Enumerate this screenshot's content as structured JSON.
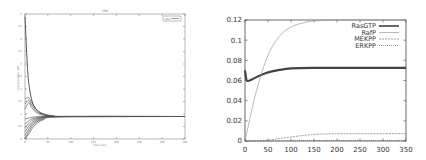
{
  "chart_data": [
    {
      "type": "line",
      "title": "ERK",
      "xlabel": "Time (sec)",
      "ylabel": "Concentration (uM)",
      "xlim": [
        0,
        350
      ],
      "ylim": [
        0,
        5
      ],
      "x_ticks": [
        "0",
        "50",
        "100",
        "150",
        "200",
        "250",
        "300",
        "350"
      ],
      "y_ticks": [
        "0",
        "0.5",
        "1",
        "1.5",
        "2",
        "2.5",
        "3",
        "3.5",
        "4",
        "4.5",
        "5"
      ],
      "legend": {
        "position": "top-right",
        "entries": [
          "ERK"
        ]
      },
      "grid": false,
      "series_description": "Ensemble of ~20 trajectories from varied initial conditions converging to a steady state near 0.9",
      "series": [
        {
          "name": "traj-high",
          "x": [
            0,
            5,
            10,
            20,
            40,
            60,
            100,
            350
          ],
          "values": [
            4.9,
            3.0,
            2.0,
            1.3,
            0.98,
            0.92,
            0.9,
            0.9
          ]
        },
        {
          "name": "traj-2",
          "x": [
            0,
            8,
            15,
            30,
            60,
            100,
            350
          ],
          "values": [
            1.6,
            1.65,
            1.45,
            1.1,
            0.93,
            0.9,
            0.9
          ]
        },
        {
          "name": "traj-3",
          "x": [
            0,
            8,
            15,
            30,
            60,
            100,
            350
          ],
          "values": [
            1.4,
            1.55,
            1.35,
            1.05,
            0.92,
            0.9,
            0.9
          ]
        },
        {
          "name": "traj-4",
          "x": [
            0,
            8,
            15,
            30,
            60,
            100,
            350
          ],
          "values": [
            1.2,
            1.45,
            1.25,
            1.0,
            0.91,
            0.9,
            0.9
          ]
        },
        {
          "name": "traj-5",
          "x": [
            0,
            10,
            20,
            40,
            80,
            350
          ],
          "values": [
            0.8,
            0.85,
            0.88,
            0.9,
            0.9,
            0.9
          ]
        },
        {
          "name": "traj-6",
          "x": [
            0,
            10,
            20,
            40,
            80,
            350
          ],
          "values": [
            0.6,
            0.75,
            0.83,
            0.88,
            0.9,
            0.9
          ]
        },
        {
          "name": "traj-7",
          "x": [
            0,
            10,
            20,
            40,
            80,
            350
          ],
          "values": [
            0.45,
            0.65,
            0.78,
            0.87,
            0.9,
            0.9
          ]
        },
        {
          "name": "traj-8",
          "x": [
            0,
            10,
            20,
            40,
            80,
            350
          ],
          "values": [
            0.3,
            0.55,
            0.72,
            0.85,
            0.9,
            0.9
          ]
        },
        {
          "name": "traj-9",
          "x": [
            0,
            10,
            20,
            40,
            80,
            350
          ],
          "values": [
            0.15,
            0.45,
            0.66,
            0.83,
            0.9,
            0.9
          ]
        },
        {
          "name": "traj-10",
          "x": [
            0,
            10,
            20,
            40,
            80,
            350
          ],
          "values": [
            0.0,
            0.35,
            0.6,
            0.8,
            0.89,
            0.9
          ]
        },
        {
          "name": "traj-11",
          "x": [
            0,
            10,
            20,
            40,
            80,
            350
          ],
          "values": [
            0.0,
            0.25,
            0.52,
            0.77,
            0.88,
            0.9
          ]
        }
      ]
    },
    {
      "type": "line",
      "title": "",
      "xlabel": "",
      "ylabel": "",
      "xlim": [
        0,
        350
      ],
      "ylim": [
        0,
        0.12
      ],
      "x_ticks": [
        "0",
        "50",
        "100",
        "150",
        "200",
        "250",
        "300",
        "350"
      ],
      "y_ticks": [
        "0",
        "0.02",
        "0.04",
        "0.06",
        "0.08",
        "0.1",
        "0.12"
      ],
      "legend": {
        "position": "top-right",
        "entries": [
          "RasGTP",
          "RafP",
          "MEKPP",
          "ERKPP"
        ]
      },
      "grid": false,
      "series": [
        {
          "name": "RasGTP",
          "x": [
            0,
            3,
            6,
            15,
            30,
            50,
            75,
            100,
            150,
            200,
            350
          ],
          "values": [
            0.07,
            0.061,
            0.0595,
            0.061,
            0.0645,
            0.068,
            0.0705,
            0.072,
            0.0725,
            0.0725,
            0.0725
          ]
        },
        {
          "name": "RafP",
          "x": [
            0,
            25,
            50,
            75,
            100,
            125,
            150,
            200,
            350
          ],
          "values": [
            0.0,
            0.05,
            0.085,
            0.104,
            0.113,
            0.117,
            0.119,
            0.12,
            0.12
          ]
        },
        {
          "name": "MEKPP",
          "x": [
            0,
            25,
            50,
            100,
            150,
            200,
            250,
            350
          ],
          "values": [
            0.0,
            0.0,
            0.0008,
            0.004,
            0.0065,
            0.0072,
            0.0073,
            0.0073
          ]
        },
        {
          "name": "ERKPP",
          "x": [
            0,
            50,
            100,
            150,
            200,
            350
          ],
          "values": [
            0.0,
            0.0001,
            0.0003,
            0.0005,
            0.0006,
            0.0006
          ]
        }
      ]
    }
  ],
  "left_chart": {
    "title": "ERK",
    "xlabel": "Time (sec)",
    "ylabel": "Concentration (uM)",
    "legend_label": "ERK"
  },
  "right_chart": {
    "legend": [
      "RasGTP",
      "RafP",
      "MEKPP",
      "ERKPP"
    ]
  }
}
